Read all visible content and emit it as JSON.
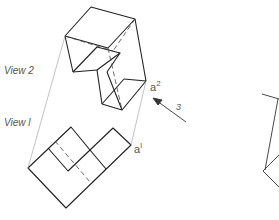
{
  "figure": {
    "labels": {
      "view2": "View 2",
      "view1": "View l",
      "point_a2_base": "a",
      "point_a2_sup": "2",
      "point_a1_base": "a",
      "point_a1_sup": "l",
      "arrow_label": "3"
    },
    "colors": {
      "line": "#222222",
      "projection": "#999999",
      "label": "#555555"
    }
  }
}
